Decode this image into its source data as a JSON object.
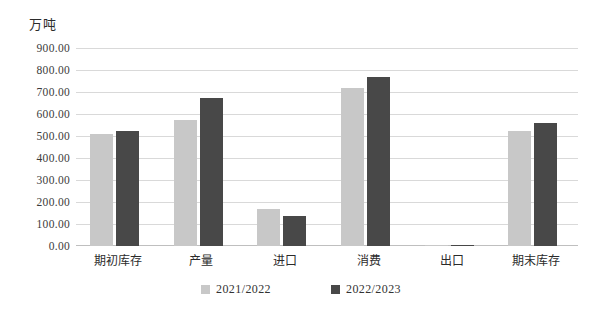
{
  "chart_data": {
    "type": "bar",
    "title": "",
    "unit_label": "万吨",
    "xlabel": "",
    "ylabel": "万吨",
    "ylim": [
      0,
      900
    ],
    "ytick_step": 100,
    "grid": true,
    "legend_position": "bottom-center",
    "categories": [
      "期初库存",
      "产量",
      "进口",
      "消费",
      "出口",
      "期末库存"
    ],
    "ytick_labels": [
      "900.00",
      "800.00",
      "700.00",
      "600.00",
      "500.00",
      "400.00",
      "300.00",
      "200.00",
      "100.00",
      "0.00"
    ],
    "series": [
      {
        "name": "2021/2022",
        "color": "#c8c8c8",
        "values": [
          511,
          575,
          170,
          718,
          5,
          523
        ]
      },
      {
        "name": "2022/2023",
        "color": "#484848",
        "values": [
          523,
          675,
          136,
          766,
          5,
          559
        ]
      }
    ]
  },
  "colors": {
    "series_light": "#c8c8c8",
    "series_dark": "#484848",
    "gridline": "#d9d9d9",
    "axis": "#bfbfbf",
    "text": "#2b2b2b"
  }
}
